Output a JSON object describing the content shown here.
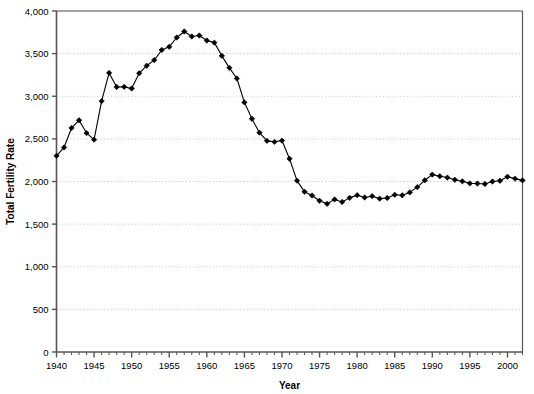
{
  "chart_data": {
    "type": "line",
    "title": "",
    "xlabel": "Year",
    "ylabel": "Total Fertility Rate",
    "xlim": [
      1940,
      2002
    ],
    "ylim": [
      0,
      4000
    ],
    "grid": true,
    "legend": false,
    "marker": "diamond",
    "line_color": "#000000",
    "marker_color": "#000000",
    "grid_color": "#c8c8c8",
    "axis_color": "#555555",
    "background": "#ffffff",
    "ytick_labels": [
      "0",
      "500",
      "1,000",
      "1,500",
      "2,000",
      "2,500",
      "3,000",
      "3,500",
      "4,000"
    ],
    "ytick_values": [
      0,
      500,
      1000,
      1500,
      2000,
      2500,
      3000,
      3500,
      4000
    ],
    "xtick_labels": [
      "1940",
      "1945",
      "1950",
      "1955",
      "1960",
      "1965",
      "1970",
      "1975",
      "1980",
      "1985",
      "1990",
      "1995",
      "2000"
    ],
    "xtick_values": [
      1940,
      1945,
      1950,
      1955,
      1960,
      1965,
      1970,
      1975,
      1980,
      1985,
      1990,
      1995,
      2000
    ],
    "x_minor_step": 1,
    "x": [
      1940,
      1941,
      1942,
      1943,
      1944,
      1945,
      1946,
      1947,
      1948,
      1949,
      1950,
      1951,
      1952,
      1953,
      1954,
      1955,
      1956,
      1957,
      1958,
      1959,
      1960,
      1961,
      1962,
      1963,
      1964,
      1965,
      1966,
      1967,
      1968,
      1969,
      1970,
      1971,
      1972,
      1973,
      1974,
      1975,
      1976,
      1977,
      1978,
      1979,
      1980,
      1981,
      1982,
      1983,
      1984,
      1985,
      1986,
      1987,
      1988,
      1989,
      1990,
      1991,
      1992,
      1993,
      1994,
      1995,
      1996,
      1997,
      1998,
      1999,
      2000,
      2001,
      2002
    ],
    "values": [
      2301,
      2399,
      2628,
      2718,
      2568,
      2491,
      2943,
      3274,
      3109,
      3110,
      3091,
      3269,
      3358,
      3424,
      3543,
      3580,
      3689,
      3760,
      3701,
      3712,
      3654,
      3629,
      3474,
      3333,
      3208,
      2928,
      2736,
      2573,
      2477,
      2465,
      2480,
      2267,
      2010,
      1879,
      1835,
      1774,
      1738,
      1790,
      1760,
      1808,
      1840,
      1812,
      1828,
      1799,
      1807,
      1844,
      1838,
      1872,
      1934,
      2014,
      2081,
      2062,
      2046,
      2020,
      2002,
      1978,
      1976,
      1971,
      2000,
      2008,
      2056,
      2034,
      2013
    ]
  },
  "axis": {
    "x_title": "Year",
    "y_title": "Total Fertility Rate"
  }
}
